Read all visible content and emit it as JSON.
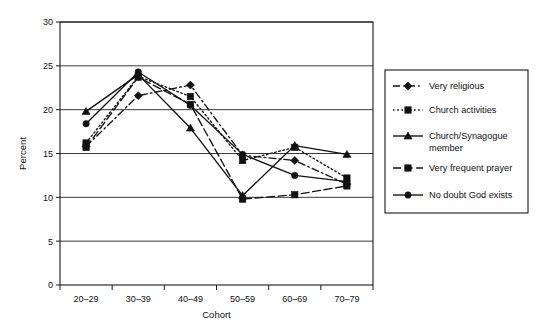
{
  "chart_data": {
    "type": "line",
    "title": "",
    "xlabel": "Cohort",
    "ylabel": "Percent",
    "categories": [
      "20–29",
      "30–39",
      "40–49",
      "50–59",
      "60–69",
      "70–79"
    ],
    "ylim": [
      0,
      30
    ],
    "yticks": [
      0,
      5,
      10,
      15,
      20,
      25,
      30
    ],
    "ytick_labels": [
      "0",
      "5",
      "10",
      "15",
      "20",
      "25",
      "30"
    ],
    "grid": true,
    "grid_axis": "y",
    "legend_position": "right",
    "series": [
      {
        "name": "Very religious",
        "marker": "diamond",
        "linestyle": "dashed",
        "color": "#111111",
        "values": [
          15.8,
          21.6,
          22.8,
          14.8,
          14.2,
          11.5
        ]
      },
      {
        "name": "Church activities",
        "marker": "square",
        "linestyle": "dotted",
        "color": "#111111",
        "values": [
          16.2,
          23.8,
          21.5,
          14.2,
          15.7,
          12.2
        ]
      },
      {
        "name": "Church/Synagogue member",
        "marker": "triangle",
        "linestyle": "solid",
        "color": "#111111",
        "values": [
          19.8,
          24.0,
          17.9,
          10.2,
          15.9,
          14.9
        ]
      },
      {
        "name": "Very frequent prayer",
        "marker": "square",
        "linestyle": "dashed-long",
        "color": "#111111",
        "values": [
          15.7,
          23.7,
          20.6,
          9.8,
          10.3,
          11.3
        ]
      },
      {
        "name": "No doubt God exists",
        "marker": "circle",
        "linestyle": "solid",
        "color": "#111111",
        "values": [
          18.4,
          24.3,
          20.5,
          14.9,
          12.5,
          11.8
        ]
      }
    ]
  },
  "legend": {
    "entries": [
      {
        "label": "Very religious"
      },
      {
        "label": "Church activities"
      },
      {
        "label": "Church/Synagogue"
      },
      {
        "label": "member"
      },
      {
        "label": "Very frequent prayer"
      },
      {
        "label": "No doubt God exists"
      }
    ]
  },
  "axes": {
    "y_title": "Percent",
    "x_title": "Cohort"
  }
}
